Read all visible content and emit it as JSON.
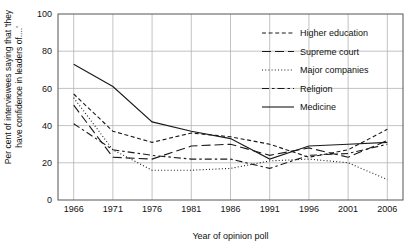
{
  "chart_data": {
    "type": "line",
    "title": "",
    "xlabel": "Year of opinion poll",
    "ylabel": "Per cent of interviewees saying that 'they\nhave confidence in leaders of....'",
    "x": [
      1966,
      1971,
      1976,
      1981,
      1986,
      1991,
      1996,
      2001,
      2006
    ],
    "xticklabels": [
      "1966",
      "1971",
      "1976",
      "1981",
      "1986",
      "1991",
      "1996",
      "2001",
      "2006"
    ],
    "yticklabels": [
      "0",
      "20",
      "40",
      "60",
      "80",
      "100"
    ],
    "yticks": [
      0,
      20,
      40,
      60,
      80,
      100
    ],
    "xlim": [
      1964,
      2008
    ],
    "ylim": [
      0,
      100
    ],
    "grid": true,
    "legend_position": "upper right",
    "series": [
      {
        "name": "Higher education",
        "style": "dashed",
        "values": [
          57,
          37,
          31,
          36,
          34,
          30,
          23,
          27,
          38
        ]
      },
      {
        "name": "Supreme court",
        "style": "longdash",
        "values": [
          51,
          23,
          22,
          29,
          30,
          24,
          28,
          23,
          32
        ]
      },
      {
        "name": "Major companies",
        "style": "dotted",
        "values": [
          55,
          27,
          16,
          16,
          17,
          21,
          22,
          20,
          11
        ]
      },
      {
        "name": "Religion",
        "style": "dashdot",
        "values": [
          41,
          27,
          24,
          22,
          22,
          17,
          24,
          25,
          30
        ]
      },
      {
        "name": "Medicine",
        "style": "solid",
        "values": [
          73,
          61,
          42,
          37,
          33,
          22,
          29,
          30,
          31
        ]
      }
    ]
  }
}
